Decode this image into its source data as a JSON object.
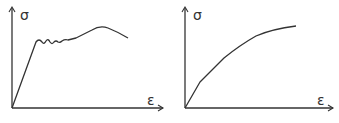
{
  "diagrams": [
    {
      "name": "yield-plateau-curve",
      "y_label": "σ",
      "x_label": "ε",
      "description": "linear elastic rise, yield plateau with serrations, strain hardening to peak, then necking drop"
    },
    {
      "name": "gradual-yield-curve",
      "y_label": "σ",
      "x_label": "ε",
      "description": "continuous concave curve without distinct yield point"
    }
  ],
  "colors": {
    "stroke": "#333333",
    "background": "#ffffff"
  }
}
